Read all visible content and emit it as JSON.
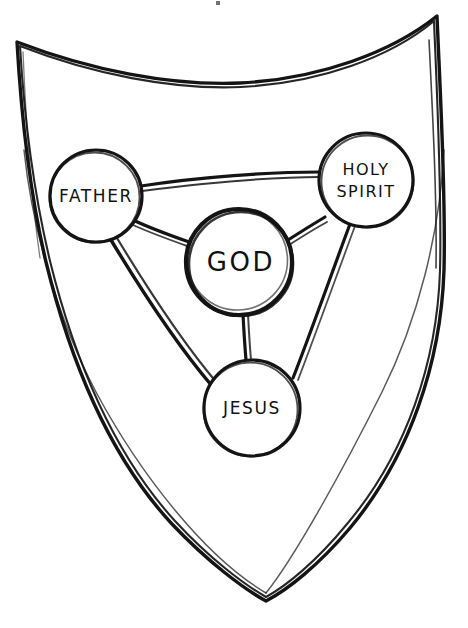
{
  "figure": {
    "kind": "hand-drawn-shield-diagram",
    "background_color": "#ffffff",
    "ink_color": "#111111",
    "shield": {
      "name": "shield-outline",
      "stroke_color": "#141414"
    },
    "nodes": [
      {
        "id": "father",
        "label": "FATHER",
        "lines": [
          "FATHER"
        ],
        "cx": 96,
        "cy": 196,
        "r": 46
      },
      {
        "id": "holy-spirit",
        "label": "HOLY SPIRIT",
        "lines": [
          "HOLY",
          "SPIRIT"
        ],
        "cx": 366,
        "cy": 180,
        "r": 47
      },
      {
        "id": "god",
        "label": "GOD",
        "lines": [
          "GOD"
        ],
        "cx": 239,
        "cy": 262,
        "r": 53
      },
      {
        "id": "jesus",
        "label": "JESUS",
        "lines": [
          "JESUS"
        ],
        "cx": 252,
        "cy": 408,
        "r": 48
      }
    ],
    "connectors": [
      {
        "id": "father-holy-spirit",
        "from": "father",
        "to": "holy-spirit"
      },
      {
        "id": "father-god",
        "from": "father",
        "to": "god"
      },
      {
        "id": "god-holy-spirit",
        "from": "god",
        "to": "holy-spirit"
      },
      {
        "id": "father-jesus",
        "from": "father",
        "to": "jesus"
      },
      {
        "id": "god-jesus",
        "from": "god",
        "to": "jesus"
      },
      {
        "id": "holy-spirit-jesus",
        "from": "holy-spirit",
        "to": "jesus"
      }
    ]
  }
}
